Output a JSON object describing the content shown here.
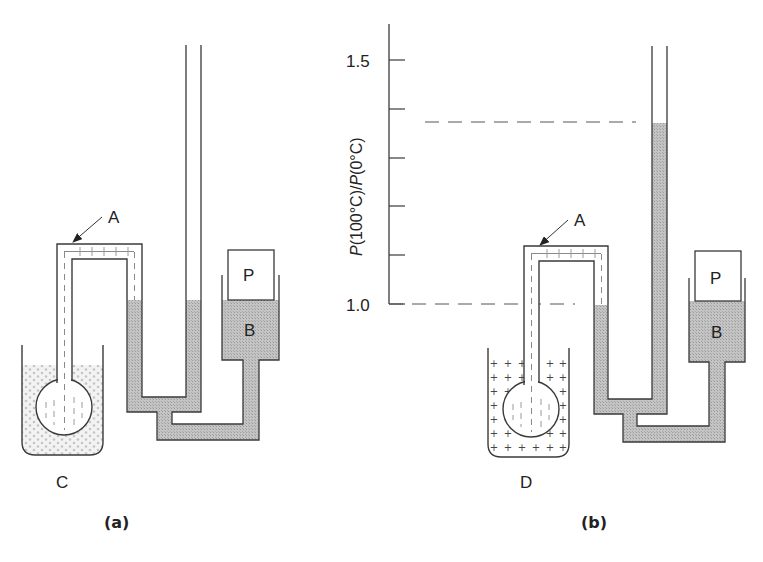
{
  "figure": {
    "panels": [
      {
        "id": "a",
        "caption": "(a)",
        "labels": {
          "gas_point": "A",
          "piston": "P",
          "reservoir": "B",
          "bath": "C"
        },
        "bath_type": "ice-water (dotted fill)"
      },
      {
        "id": "b",
        "caption": "(b)",
        "labels": {
          "gas_point": "A",
          "piston": "P",
          "reservoir": "B",
          "bath": "D"
        },
        "bath_type": "boiling water (plus-sign fill)"
      }
    ],
    "scale": {
      "axis_title_prefix": "P",
      "axis_title_mid": "(100°C)/",
      "axis_title_prefix2": "P",
      "axis_title_suffix": "(0°C)",
      "tick_labels": [
        "1.5",
        "1.0"
      ],
      "range": [
        1.0,
        1.5
      ],
      "minor_tick_step": 0.1,
      "indicated_ratio": 1.37
    },
    "colors": {
      "line": "#3a3a3a",
      "mercury": "#bdbdbd",
      "gas_dash": "#8a8a8a",
      "bath_c_dots": "#c8c8c8"
    }
  }
}
